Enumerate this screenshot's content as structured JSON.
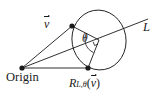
{
  "figure": {
    "type": "geometric-diagram",
    "background_color": "#ffffff",
    "stroke_color": "#1a1a1a",
    "width": 158,
    "height": 96,
    "labels": {
      "origin": "Origin",
      "vector_v": "v",
      "angle": "θ",
      "line": "L",
      "rotation_operator": "R",
      "rotation_subscript": "L,θ",
      "rotation_argument": "v",
      "paren_open": "(",
      "paren_close": ")"
    },
    "points": [
      {
        "name": "origin",
        "x": 22,
        "y": 68
      },
      {
        "name": "vector-v-tip",
        "x": 72,
        "y": 26
      },
      {
        "name": "rotated-vector-tip",
        "x": 88,
        "y": 68
      },
      {
        "name": "circle-center",
        "x": 99,
        "y": 40
      }
    ],
    "elements": [
      "ellipse-rotation-path",
      "axis-line-L",
      "vector-v-segment",
      "rotated-vector-segment",
      "radius-to-v-tip",
      "radius-to-rotated-tip",
      "angle-arc",
      "right-angle-marker"
    ]
  }
}
